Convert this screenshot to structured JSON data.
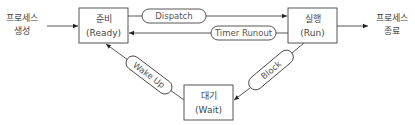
{
  "diagram": {
    "external": {
      "create": {
        "line1": "프로세스",
        "line2": "생성"
      },
      "terminate": {
        "line1": "프로세스",
        "line2": "종료"
      }
    },
    "states": [
      {
        "id": "ready",
        "name": "준비",
        "english": "(Ready)"
      },
      {
        "id": "run",
        "name": "실행",
        "english": "(Run)"
      },
      {
        "id": "wait",
        "name": "대기",
        "english": "(Wait)"
      }
    ],
    "transitions": [
      {
        "id": "dispatch",
        "label": "Dispatch",
        "from": "ready",
        "to": "run"
      },
      {
        "id": "timer-runout",
        "label": "Timer Runout",
        "from": "run",
        "to": "ready"
      },
      {
        "id": "block",
        "label": "Block",
        "from": "run",
        "to": "wait"
      },
      {
        "id": "wake-up",
        "label": "Wake Up",
        "from": "wait",
        "to": "ready"
      }
    ],
    "colors": {
      "stroke": "#444444",
      "text": "#444444",
      "background": "#ffffff"
    }
  }
}
